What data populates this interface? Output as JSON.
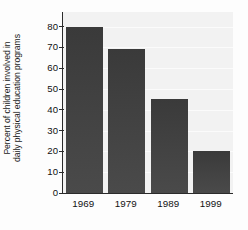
{
  "chart_data": {
    "type": "bar",
    "title": "",
    "xlabel": "",
    "ylabel": "Percent of children involved in\ndaily physical education programs",
    "ylabel_line1": "Percent of children involved in",
    "ylabel_line2": "daily physical education programs",
    "categories": [
      "1969",
      "1979",
      "1989",
      "1999"
    ],
    "values": [
      80,
      69,
      45,
      20
    ],
    "ylim": [
      0,
      87
    ],
    "yticks": [
      0,
      10,
      20,
      30,
      40,
      50,
      60,
      70,
      80
    ],
    "ytick_labels": [
      "0",
      "10",
      "20",
      "30",
      "40",
      "50",
      "60",
      "70",
      "80"
    ],
    "grid": false,
    "legend": null,
    "series": [
      {
        "name": "Percent of children involved in daily physical education programs",
        "values": [
          80,
          69,
          45,
          20
        ]
      }
    ],
    "bar_color": "#3f3f3f",
    "plot_background": "#f2f2f2",
    "axis_color": "#2b2b2b"
  }
}
